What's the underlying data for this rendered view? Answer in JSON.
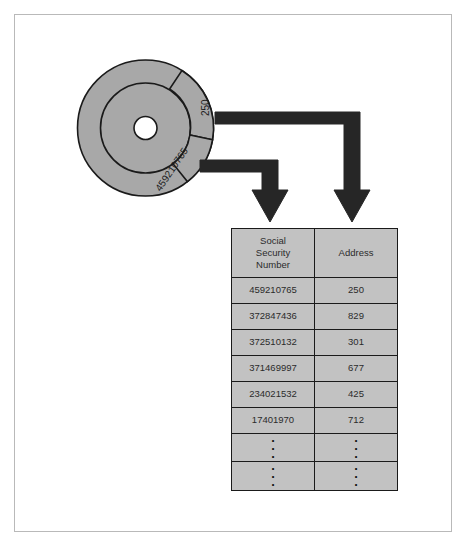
{
  "figure": {
    "background_color": "#ffffff",
    "frame_color": "#b9b9b9"
  },
  "disk": {
    "name": "storage-disk",
    "fill_color": "#a8a8a8",
    "outline_color": "#1a1a1a",
    "center_hole_color": "#ffffff",
    "slices": [
      {
        "label": "250",
        "name": "disk-slice-address"
      },
      {
        "label": "459210765",
        "name": "disk-slice-ssn"
      }
    ]
  },
  "arrows": {
    "color": "#1f1f1f",
    "items": [
      {
        "name": "arrow-address",
        "from": "250",
        "to": "Address"
      },
      {
        "name": "arrow-ssn",
        "from": "459210765",
        "to": "Social Security Number"
      }
    ]
  },
  "table": {
    "name": "record-table",
    "cell_fill": "#c2c2c2",
    "border_color": "#1a1a1a",
    "columns": [
      {
        "header_lines": [
          "Social",
          "Security",
          "Number"
        ],
        "header": "Social Security Number"
      },
      {
        "header_lines": [
          "Address"
        ],
        "header": "Address"
      }
    ],
    "rows": [
      {
        "ssn": "459210765",
        "address": "250"
      },
      {
        "ssn": "372847436",
        "address": "829"
      },
      {
        "ssn": "372510132",
        "address": "301"
      },
      {
        "ssn": "371469997",
        "address": "677"
      },
      {
        "ssn": "234021532",
        "address": "425"
      },
      {
        "ssn": "17401970",
        "address": "712"
      },
      {
        "ssn": "⋮",
        "address": "⋮"
      },
      {
        "ssn": "⋮",
        "address": "⋮"
      }
    ]
  }
}
